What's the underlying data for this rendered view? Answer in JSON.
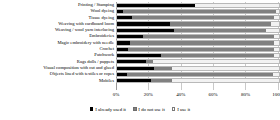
{
  "chart_data": {
    "type": "bar",
    "orientation": "horizontal",
    "stacked": true,
    "stack_mode": "percent",
    "title": "",
    "subtitle": "",
    "xlabel": "",
    "ylabel": "",
    "xlim": [
      0,
      100
    ],
    "grid": true,
    "legend_position": "bottom",
    "xticks": [
      "0%",
      "20%",
      "40%",
      "60%",
      "80%",
      "100%"
    ],
    "xtick_values": [
      0,
      20,
      40,
      60,
      80,
      100
    ],
    "categories": [
      "Printing / Stamping",
      "Wool dyeing",
      "Tissue dyeing",
      "Weaving with cardboard loom",
      "Weaving / wool yarn interlacing",
      "Embroideries",
      "Magic embroidery with needle",
      "Crochet",
      "Patchwork",
      "Rags dolls / puppets",
      "Visual composition with cut and glued",
      "Objects lined with textiles or ropes",
      "Mobiles"
    ],
    "series": [
      {
        "name": "I already used it",
        "color": "#000000",
        "values": [
          48,
          4,
          9,
          33,
          35,
          16,
          8,
          7,
          27,
          18,
          23,
          6,
          21
        ]
      },
      {
        "name": "I do not use it",
        "color": "#808080",
        "values": [
          0,
          94,
          88,
          62,
          57,
          81,
          89,
          90,
          70,
          4,
          11,
          90,
          13
        ]
      },
      {
        "name": "I use it",
        "color": "#F2F2F2",
        "values": [
          52,
          2,
          3,
          5,
          8,
          3,
          3,
          3,
          3,
          78,
          66,
          4,
          66
        ]
      }
    ]
  },
  "legend": {
    "items": [
      {
        "label": "I already used it",
        "swatch": "square-filled-black"
      },
      {
        "label": "I do not use it",
        "swatch": "square-filled-gray"
      },
      {
        "label": "I use it",
        "swatch": "square-outline-white"
      }
    ]
  }
}
